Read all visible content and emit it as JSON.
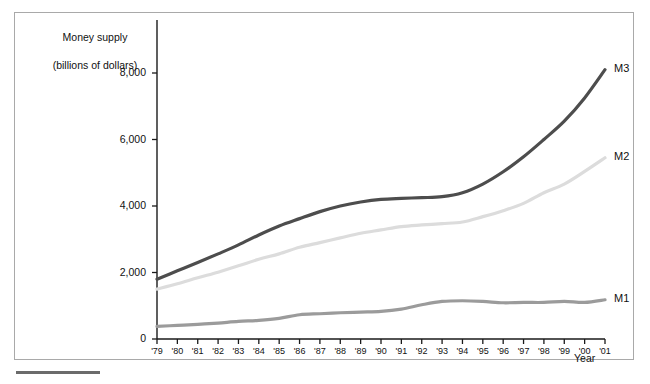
{
  "chart_data": {
    "type": "line",
    "title": "",
    "ylabel": "Money supply\n(billions of dollars)",
    "ylabel_line1": "Money supply",
    "ylabel_line2": "(billions of dollars)",
    "xlabel": "Year",
    "grid": false,
    "legend_position": "right-inline-end-of-line",
    "ylim": [
      0,
      8800
    ],
    "yticks": [
      0,
      2000,
      4000,
      6000,
      8000
    ],
    "ytick_labels": [
      "0",
      "2,000",
      "4,000",
      "6,000",
      "8,000"
    ],
    "categories": [
      "'79",
      "'80",
      "'81",
      "'82",
      "'83",
      "'84",
      "'85",
      "'86",
      "'87",
      "'88",
      "'89",
      "'90",
      "'91",
      "'92",
      "'93",
      "'94",
      "'95",
      "'96",
      "'97",
      "'98",
      "'99",
      "'00",
      "'01"
    ],
    "x": [
      1979,
      1980,
      1981,
      1982,
      1983,
      1984,
      1985,
      1986,
      1987,
      1988,
      1989,
      1990,
      1991,
      1992,
      1993,
      1994,
      1995,
      1996,
      1997,
      1998,
      1999,
      2000,
      2001
    ],
    "series": [
      {
        "name": "M3",
        "color": "#4d4d4d",
        "label": "M3",
        "values": [
          1800,
          2050,
          2300,
          2560,
          2830,
          3130,
          3400,
          3620,
          3830,
          4000,
          4120,
          4200,
          4230,
          4250,
          4280,
          4400,
          4660,
          5030,
          5480,
          6000,
          6550,
          7250,
          8100
        ]
      },
      {
        "name": "M2",
        "color": "#dcdcdc",
        "label": "M2",
        "values": [
          1500,
          1660,
          1840,
          2010,
          2200,
          2400,
          2560,
          2760,
          2900,
          3040,
          3180,
          3280,
          3380,
          3430,
          3470,
          3520,
          3680,
          3860,
          4080,
          4400,
          4660,
          5040,
          5450
        ]
      },
      {
        "name": "M1",
        "color": "#9b9b9b",
        "label": "M1",
        "values": [
          380,
          410,
          440,
          480,
          530,
          560,
          620,
          730,
          760,
          790,
          810,
          830,
          900,
          1030,
          1130,
          1150,
          1130,
          1090,
          1100,
          1100,
          1130,
          1100,
          1180
        ]
      }
    ]
  },
  "axis": {
    "y_title_line1": "Money supply",
    "y_title_line2": "(billions of dollars)",
    "x_title": "Year"
  }
}
